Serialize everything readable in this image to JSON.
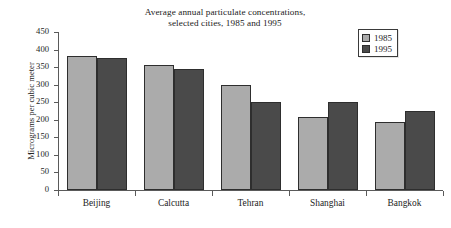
{
  "chart_data": {
    "type": "bar",
    "title": "Average annual particulate concentrations, selected cities, 1985 and 1995",
    "title_lines": [
      "Average annual particulate concentrations,",
      "selected cities, 1985 and 1995"
    ],
    "xlabel": "",
    "ylabel": "Micrograms per cubic meter",
    "categories": [
      "Beijing",
      "Calcutta",
      "Tehran",
      "Shanghai",
      "Bangkok"
    ],
    "series": [
      {
        "name": "1985",
        "color": "#ababab",
        "values": [
          382,
          356,
          300,
          207,
          195
        ]
      },
      {
        "name": "1995",
        "color": "#4a4a4a",
        "values": [
          375,
          345,
          250,
          250,
          226
        ]
      }
    ],
    "ylim": [
      0,
      450
    ],
    "ytick_step": 50,
    "ytick_labels": [
      "450",
      "400",
      "350",
      "300",
      "250",
      "200",
      "150",
      "100",
      "50",
      "0"
    ],
    "grid": false,
    "legend_position": "top-right",
    "legend_entries": [
      "1985",
      "1995"
    ]
  },
  "legend": {
    "items": [
      {
        "label": "1985"
      },
      {
        "label": "1995"
      }
    ]
  }
}
